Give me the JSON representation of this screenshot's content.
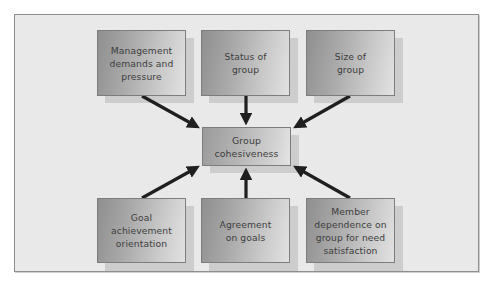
{
  "diagram": {
    "center": {
      "id": "group-cohesiveness",
      "label": "Group\ncohesiveness"
    },
    "factors": [
      {
        "id": "management-demands",
        "label": "Management\ndemands and\npressure",
        "row": "top"
      },
      {
        "id": "status-of-group",
        "label": "Status of\ngroup",
        "row": "top"
      },
      {
        "id": "size-of-group",
        "label": "Size of\ngroup",
        "row": "top"
      },
      {
        "id": "goal-achievement",
        "label": "Goal\nachievement\norientation",
        "row": "bottom"
      },
      {
        "id": "agreement-on-goals",
        "label": "Agreement\non goals",
        "row": "bottom"
      },
      {
        "id": "member-dependence",
        "label": "Member\ndependence on\ngroup for need\nsatisfaction",
        "row": "bottom"
      }
    ],
    "edges": [
      {
        "from": "management-demands",
        "to": "group-cohesiveness"
      },
      {
        "from": "status-of-group",
        "to": "group-cohesiveness"
      },
      {
        "from": "size-of-group",
        "to": "group-cohesiveness"
      },
      {
        "from": "goal-achievement",
        "to": "group-cohesiveness"
      },
      {
        "from": "agreement-on-goals",
        "to": "group-cohesiveness"
      },
      {
        "from": "member-dependence",
        "to": "group-cohesiveness"
      }
    ],
    "colors": {
      "frame_bg": "#e9e9e9",
      "box_border": "#7d7d7d",
      "arrow": "#1f1f1f",
      "text": "#3d3d3d"
    }
  }
}
